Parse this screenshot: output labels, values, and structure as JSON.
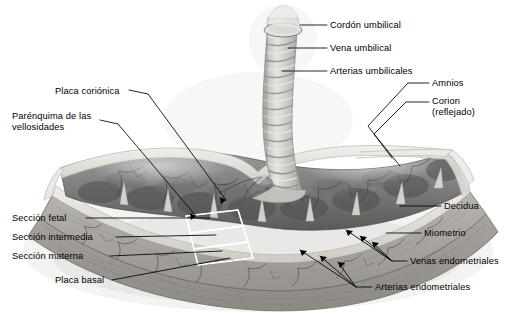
{
  "figure": {
    "kind": "anatomical-cross-section",
    "language": "es",
    "background_color": "#ffffff",
    "ink_color": "#000000",
    "palette": {
      "placenta_body": "#8a8a8a",
      "placenta_dark": "#5d5d5d",
      "chorionic_plate": "#d8d6d2",
      "basal_plate": "#c9c6c0",
      "decidua": "#a9a6a0",
      "myometrium": "#9a9792",
      "septa": "#ddd9d2",
      "cord": "#cfcdc9",
      "membrane": "#e4e2de"
    }
  },
  "labels": [
    {
      "id": "cordon-umbilical",
      "text": "Cordón umbilical",
      "x": 330,
      "y": 26,
      "align": "left"
    },
    {
      "id": "vena-umbilical",
      "text": "Vena umbilical",
      "x": 330,
      "y": 49,
      "align": "left"
    },
    {
      "id": "arterias-umbilicales",
      "text": "Arterias umbilicales",
      "x": 330,
      "y": 72,
      "align": "left"
    },
    {
      "id": "amnios",
      "text": "Amnios",
      "x": 432,
      "y": 80,
      "align": "left"
    },
    {
      "id": "corion-reflejado",
      "text": "Corion\n(reflejado)",
      "x": 432,
      "y": 99,
      "align": "left"
    },
    {
      "id": "placa-corionica",
      "text": "Placa coriónica",
      "x": 55,
      "y": 93,
      "align": "left"
    },
    {
      "id": "parenquima-vellosidades",
      "text": "Parénquima de las\nvellosidades",
      "x": 12,
      "y": 117,
      "align": "left"
    },
    {
      "id": "decidua",
      "text": "Decidua",
      "x": 444,
      "y": 207,
      "align": "left"
    },
    {
      "id": "miometrio",
      "text": "Miometrio",
      "x": 424,
      "y": 234,
      "align": "left"
    },
    {
      "id": "venas-endometriales",
      "text": "Venas endometriales",
      "x": 410,
      "y": 262,
      "align": "left"
    },
    {
      "id": "arterias-endometriales",
      "text": "Arterias endometriales",
      "x": 375,
      "y": 288,
      "align": "left"
    },
    {
      "id": "seccion-fetal",
      "text": "Sección fetal",
      "x": 12,
      "y": 219,
      "align": "left"
    },
    {
      "id": "seccion-intermedia",
      "text": "Sección intermedia",
      "x": 12,
      "y": 238,
      "align": "left"
    },
    {
      "id": "seccion-materna",
      "text": "Sección materna",
      "x": 12,
      "y": 257,
      "align": "left"
    },
    {
      "id": "placa-basal",
      "text": "Placa basal",
      "x": 55,
      "y": 281,
      "align": "left"
    }
  ],
  "structures": [
    {
      "id": "umbilical-cord",
      "name": "Cordón umbilical",
      "note": "cordón helicoidal seccionado en el extremo superior"
    },
    {
      "id": "umbilical-vein",
      "name": "Vena umbilical",
      "note": "vaso único del cordón"
    },
    {
      "id": "umbilical-arteries",
      "name": "Arterias umbilicales",
      "note": "dos arterias espirales"
    },
    {
      "id": "amnion",
      "name": "Amnios",
      "note": "membrana más interna, reflejada en el borde"
    },
    {
      "id": "chorion",
      "name": "Corion (reflejado)",
      "note": "membrana externa replegada"
    },
    {
      "id": "chorionic-plate",
      "name": "Placa coriónica",
      "note": "superficie fetal de la placenta"
    },
    {
      "id": "villous-parenchyma",
      "name": "Parénquima de las vellosidades",
      "note": "masa vellositaria entre placas"
    },
    {
      "id": "basal-plate",
      "name": "Placa basal",
      "note": "superficie materna de la placenta"
    },
    {
      "id": "decidua",
      "name": "Decidua",
      "note": "decidua basal bajo la placa basal"
    },
    {
      "id": "myometrium",
      "name": "Miometrio",
      "note": "capa muscular uterina más externa"
    },
    {
      "id": "endometrial-veins",
      "name": "Venas endometriales",
      "note": "drenan el espacio intervelloso"
    },
    {
      "id": "endometrial-arteries",
      "name": "Arterias endometriales",
      "note": "arterias espirales aportadoras"
    },
    {
      "id": "placental-septa",
      "name": "Tabiques placentarios",
      "note": "cuñas claras que separan cotiledones"
    },
    {
      "id": "cotyledon-sections",
      "name": "Secciones del cotiledón",
      "note": "tres cajas: fetal, intermedia, materna"
    }
  ],
  "section_boxes": [
    {
      "id": "box-fetal",
      "label_ref": "seccion-fetal"
    },
    {
      "id": "box-intermedia",
      "label_ref": "seccion-intermedia"
    },
    {
      "id": "box-materna",
      "label_ref": "seccion-materna"
    }
  ]
}
